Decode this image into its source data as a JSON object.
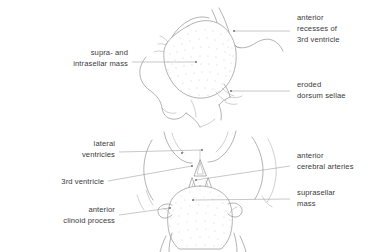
{
  "figure": {
    "background_color": "#ffffff",
    "line_color": "#8a8a8a",
    "leader_color": "#9a9a9a",
    "text_color": "#3a3a3a"
  },
  "panels": [
    {
      "id": "sagittal",
      "name": "upper-sagittal-panel",
      "labels": [
        {
          "id": "supra-intrasellar-mass",
          "line1": "supra- and",
          "line2": "intrasellar mass",
          "align": "right",
          "text_x": 128,
          "text_y1": 55,
          "text_y2": 66,
          "leader": "M132,62 L196,62",
          "dot_x": 196,
          "dot_y": 62
        },
        {
          "id": "anterior-recesses-3rd-ventricle",
          "line1": "anterior",
          "line2": "recesses of",
          "line3": "3rd ventricle",
          "align": "left",
          "text_x": 297,
          "text_y1": 20,
          "text_y2": 31,
          "text_y3": 42,
          "leader": "M290,31 L234,31",
          "dot_x": 234,
          "dot_y": 31
        },
        {
          "id": "eroded-dorsum-sellae",
          "line1": "eroded",
          "line2": "dorsum sellae",
          "align": "left",
          "text_x": 297,
          "text_y1": 87,
          "text_y2": 98,
          "leader": "M290,91 L231,91",
          "dot_x": 231,
          "dot_y": 91
        }
      ]
    },
    {
      "id": "axial",
      "name": "lower-axial-panel",
      "labels": [
        {
          "id": "lateral-ventricles",
          "line1": "lateral",
          "line2": "ventricles",
          "align": "right",
          "text_x": 115,
          "text_y1": 146,
          "text_y2": 157,
          "leader": "M119,152 L202,150",
          "dot_x": 202,
          "dot_y": 150
        },
        {
          "id": "3rd-ventricle",
          "line1": "3rd ventricle",
          "align": "right",
          "text_x": 104,
          "text_y1": 184,
          "leader": "M108,181 L192,166",
          "dot_x": 192,
          "dot_y": 166
        },
        {
          "id": "anterior-clinoid-process",
          "line1": "anterior",
          "line2": "clinoid process",
          "align": "right",
          "text_x": 115,
          "text_y1": 212,
          "text_y2": 223,
          "leader": "M119,215 L170,208",
          "dot_x": 170,
          "dot_y": 208
        },
        {
          "id": "anterior-cerebral-arteries",
          "line1": "anterior",
          "line2": "cerebral arteries",
          "align": "left",
          "text_x": 297,
          "text_y1": 158,
          "text_y2": 169,
          "leader": "M290,166 L196,180",
          "dot_x": 196,
          "dot_y": 180
        },
        {
          "id": "suprasellar-mass",
          "line1": "suprasellar",
          "line2": "mass",
          "align": "left",
          "text_x": 297,
          "text_y1": 195,
          "text_y2": 206,
          "leader": "M290,199 L193,200",
          "dot_x": 193,
          "dot_y": 200
        }
      ]
    }
  ]
}
